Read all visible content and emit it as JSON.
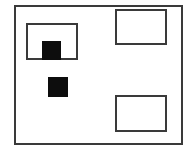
{
  "diagram": {
    "canvas": {
      "width": 188,
      "height": 155,
      "background": "#ffffff"
    },
    "stroke_color": "#3a3a3a",
    "fill_color": "#0d0d0d",
    "outer_frame": {
      "x": 14,
      "y": 5,
      "w": 169,
      "h": 140,
      "stroke_width": 2
    },
    "boxes": [
      {
        "id": "box-top-left",
        "x": 26,
        "y": 23,
        "w": 52,
        "h": 37,
        "stroke_width": 2
      },
      {
        "id": "box-top-right",
        "x": 115,
        "y": 9,
        "w": 52,
        "h": 36,
        "stroke_width": 2
      },
      {
        "id": "box-bottom-right",
        "x": 115,
        "y": 95,
        "w": 52,
        "h": 37,
        "stroke_width": 2
      }
    ],
    "filled_squares": [
      {
        "id": "square-in-top-left-box",
        "x": 42,
        "y": 41,
        "w": 19,
        "h": 19
      },
      {
        "id": "square-middle-left",
        "x": 48,
        "y": 77,
        "w": 20,
        "h": 20
      }
    ]
  }
}
